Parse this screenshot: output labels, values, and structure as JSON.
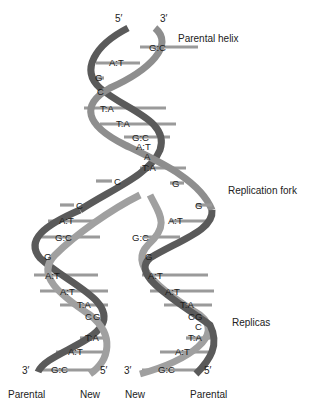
{
  "diagram": {
    "labels": {
      "parental_helix": "Parental helix",
      "replication_fork": "Replication fork",
      "replicas": "Replicas"
    },
    "top_ends": {
      "left": "5′",
      "right": "3′"
    },
    "bottom_left": {
      "left_end": "3′",
      "right_end": "5′",
      "strand_left": "Parental",
      "strand_right": "New"
    },
    "bottom_right": {
      "left_end": "3′",
      "right_end": "5′",
      "strand_left": "New",
      "strand_right": "Parental"
    },
    "parental_pairs": [
      "G:C",
      "A:T",
      "G",
      "C",
      "T:A",
      "T:A",
      "G:C",
      "A:T",
      "A",
      "T:A"
    ],
    "fork_unpaired": {
      "left": [
        "C",
        "C"
      ],
      "right": [
        "G",
        "G"
      ]
    },
    "left_replica_pairs": [
      "A:T",
      "G:C",
      "G",
      "A:T",
      "A:T",
      "T:A",
      "C",
      "G",
      "T:A",
      "A:T",
      "G:C"
    ],
    "right_replica_pairs": [
      "A:T",
      "G:C",
      "G",
      "A:T",
      "A:T",
      "T:A",
      "C",
      "G",
      "C",
      "T:A",
      "A:T",
      "G:C"
    ],
    "colors": {
      "strand_dark": "#5a5a5a",
      "strand_light": "#b5b5b5",
      "rung": "#9a9a9a",
      "background": "#ffffff"
    }
  }
}
